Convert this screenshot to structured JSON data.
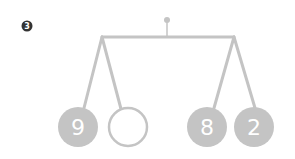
{
  "problem": {
    "number": "3"
  },
  "mobile": {
    "colors": {
      "line": "#c4c4c4",
      "ball_fill": "#c4c4c4",
      "ball_text": "#ffffff",
      "empty_stroke": "#c4c4c4",
      "badge_fill": "#333333"
    },
    "balls": [
      {
        "label": "9",
        "filled": true
      },
      {
        "label": "",
        "filled": false
      },
      {
        "label": "8",
        "filled": true
      },
      {
        "label": "2",
        "filled": true
      }
    ]
  }
}
